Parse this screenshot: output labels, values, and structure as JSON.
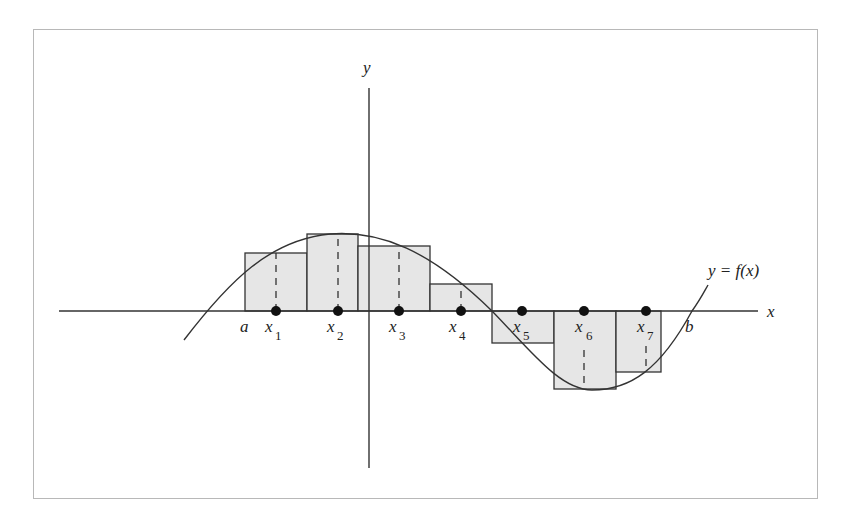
{
  "diagram": {
    "axes": {
      "x_label": "x",
      "y_label": "y"
    },
    "curve_label": "y = f(x)",
    "interval": {
      "a": "a",
      "b": "b"
    },
    "points": [
      {
        "name": "x",
        "sub": "1"
      },
      {
        "name": "x",
        "sub": "2"
      },
      {
        "name": "x",
        "sub": "3"
      },
      {
        "name": "x",
        "sub": "4"
      },
      {
        "name": "x",
        "sub": "5"
      },
      {
        "name": "x",
        "sub": "6"
      },
      {
        "name": "x",
        "sub": "7"
      }
    ],
    "colors": {
      "rect_fill": "#e6e6e6",
      "stroke": "#333333",
      "frame": "#b8b8b8"
    }
  }
}
